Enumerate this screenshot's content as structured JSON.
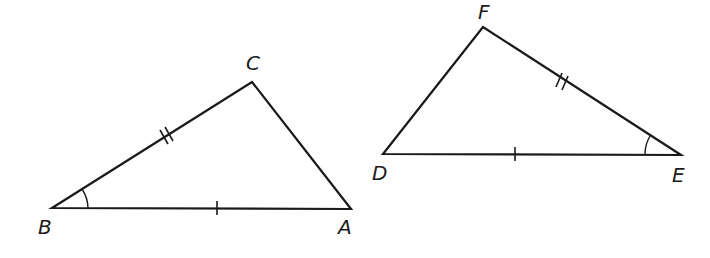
{
  "figure": {
    "colors": {
      "background": "#ffffff",
      "stroke": "#1a1a1a"
    },
    "triangle_abc": {
      "vertices": {
        "A": {
          "label": "A",
          "x": 351,
          "y": 209,
          "label_x": 338,
          "label_y": 234
        },
        "B": {
          "label": "B",
          "x": 52,
          "y": 208,
          "label_x": 38,
          "label_y": 234
        },
        "C": {
          "label": "C",
          "x": 252,
          "y": 82,
          "label_x": 246,
          "label_y": 70
        }
      },
      "marks": {
        "BA": "single tick",
        "BC": "double tick",
        "angle_B": "single arc"
      }
    },
    "triangle_def": {
      "vertices": {
        "D": {
          "label": "D",
          "x": 383,
          "y": 154,
          "label_x": 372,
          "label_y": 180
        },
        "E": {
          "label": "E",
          "x": 681,
          "y": 155,
          "label_x": 672,
          "label_y": 182
        },
        "F": {
          "label": "F",
          "x": 483,
          "y": 27,
          "label_x": 478,
          "label_y": 19
        }
      },
      "marks": {
        "DE": "single tick",
        "FE": "double tick",
        "angle_E": "single arc"
      }
    }
  }
}
